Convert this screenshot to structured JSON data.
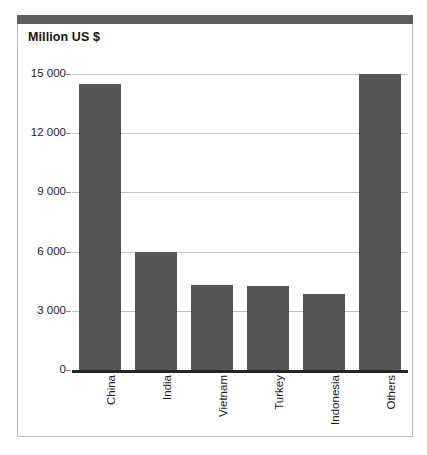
{
  "chart": {
    "title": "Million US $",
    "axis_zero_label": "0"
  },
  "chart_data": {
    "type": "bar",
    "title": "Million US $",
    "xlabel": "",
    "ylabel": "Million US $",
    "categories": [
      "China",
      "India",
      "Vietnam",
      "Turkey",
      "Indonesia",
      "Others"
    ],
    "values": [
      14500,
      6000,
      4300,
      4250,
      3850,
      15000
    ],
    "ylim": [
      0,
      15000
    ],
    "yticks": [
      0,
      3000,
      6000,
      9000,
      12000,
      15000
    ],
    "ytick_labels": [
      "0",
      "3 000",
      "6 000",
      "9 000",
      "12 000",
      "15 000"
    ],
    "grid": true,
    "legend": false,
    "bar_color": "#555555",
    "gridline_color": "#c7c7c7",
    "xtick_rotation": 90
  }
}
